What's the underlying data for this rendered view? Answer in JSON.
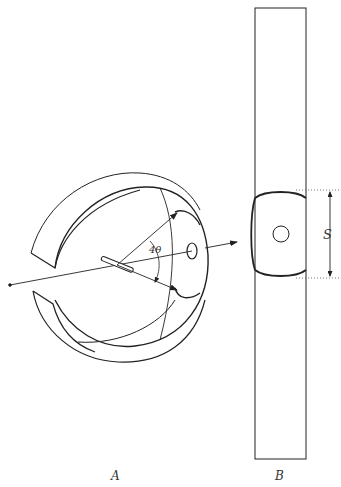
{
  "figure": {
    "panels": [
      {
        "id": "A",
        "label": "A",
        "description": "Sphere with cut-away cylindrical film band; incident beam along axis, diffracted rays at angle 4θ"
      },
      {
        "id": "B",
        "label": "B",
        "description": "Unrolled film strip showing diffraction arcs separated by distance S and central beam hole"
      }
    ],
    "annotations": {
      "angle": "4θ",
      "distance": "S"
    },
    "colors": {
      "line": "#222222",
      "background": "#ffffff",
      "dotted": "#555555"
    }
  }
}
